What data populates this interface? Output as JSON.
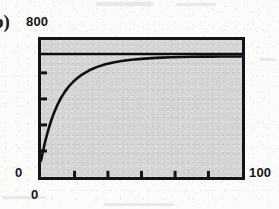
{
  "figure": {
    "panel_letter": "b)",
    "background_color": "#fbfbf9",
    "plot_fill_color": "#d4d4d2",
    "axis_color": "#141418",
    "curve_color": "#101014"
  },
  "labels": {
    "y_max": "800",
    "y_min": "0",
    "x_min": "0",
    "x_max": "100"
  },
  "chart_data": {
    "type": "line",
    "title": "",
    "subtitle": "",
    "xlabel": "",
    "ylabel": "",
    "xlim": [
      0,
      100
    ],
    "ylim": [
      0,
      800
    ],
    "grid": false,
    "legend": null,
    "x_tick_labels": [
      "0",
      "100"
    ],
    "y_tick_labels": [
      "0",
      "800"
    ],
    "x_interior_tick_count": 5,
    "y_interior_tick_count": 4,
    "x_interior_ticks": [
      16.7,
      33.3,
      50.0,
      66.7,
      83.3
    ],
    "y_interior_ticks": [
      152,
      304,
      456,
      608
    ],
    "series": [
      {
        "name": "saturating-exponential",
        "style": "solid",
        "x": [
          0,
          1,
          2,
          3,
          4,
          5,
          6,
          8,
          10,
          12,
          14,
          16,
          18,
          20,
          24,
          28,
          32,
          36,
          40,
          45,
          50,
          55,
          60,
          65,
          70,
          75,
          80,
          85,
          90,
          95,
          100
        ],
        "y": [
          95,
          152,
          203,
          249,
          290,
          327,
          360,
          417,
          463,
          500,
          531,
          556,
          577,
          595,
          623,
          643,
          658,
          669,
          677,
          685,
          690,
          694,
          697,
          699,
          701,
          702,
          703,
          703,
          704,
          704,
          704
        ]
      },
      {
        "name": "asymptote",
        "style": "horizontal-line",
        "y_value": 718,
        "x": [
          0,
          100
        ],
        "y": [
          718,
          718
        ]
      }
    ],
    "annotations": []
  }
}
